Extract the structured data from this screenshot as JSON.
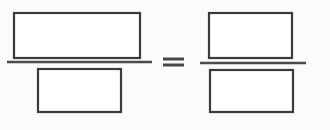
{
  "figure": {
    "background_color": "#fbfbfb",
    "ink_color": "#3b3b3f",
    "fill_color": "#ffffff",
    "canvas": {
      "width": 330,
      "height": 130
    },
    "operator": {
      "name": "equals-sign",
      "symbol": "=",
      "x": 163,
      "y": 62,
      "bar_width": 21,
      "bar_thickness": 3,
      "bar_gap": 6,
      "color": "#47474b"
    },
    "fractions": [
      {
        "id": "left-fraction",
        "label": "left fraction",
        "numerator": {
          "name": "left-numerator-rectangle",
          "x": 14,
          "y": 13,
          "width": 126,
          "height": 45,
          "stroke_width": 2.2
        },
        "bar": {
          "name": "left-fraction-bar",
          "x1": 7,
          "x2": 152,
          "y": 62,
          "thickness": 2.6
        },
        "denominator": {
          "name": "left-denominator-rectangle",
          "x": 38,
          "y": 69,
          "width": 83,
          "height": 43,
          "stroke_width": 2.2
        }
      },
      {
        "id": "right-fraction",
        "label": "right fraction",
        "numerator": {
          "name": "right-numerator-rectangle",
          "x": 209,
          "y": 13,
          "width": 83,
          "height": 45,
          "stroke_width": 2.2
        },
        "bar": {
          "name": "right-fraction-bar",
          "x1": 200,
          "x2": 306,
          "y": 63,
          "thickness": 2.6
        },
        "denominator": {
          "name": "right-denominator-rectangle",
          "x": 210,
          "y": 70,
          "width": 83,
          "height": 42,
          "stroke_width": 2.2
        }
      }
    ]
  }
}
